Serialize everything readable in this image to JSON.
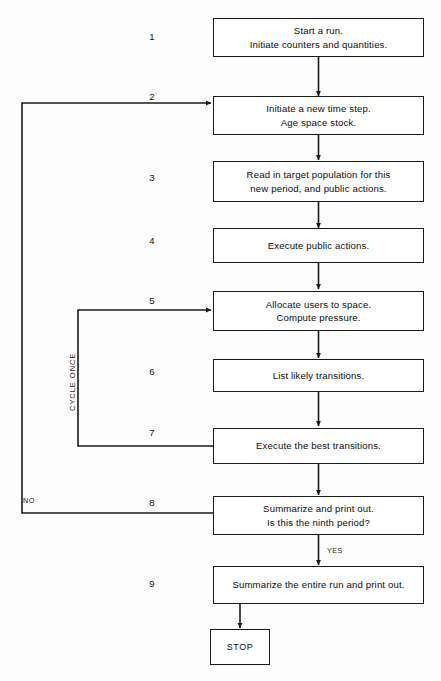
{
  "diagram": {
    "line_color": "#1a1a1a",
    "background": "#fdfdfd"
  },
  "steps": [
    {
      "number": "1",
      "lines": [
        "Start a run.",
        "Initiate counters and quantities."
      ]
    },
    {
      "number": "2",
      "lines": [
        "Initiate a new time step.",
        "Age space stock."
      ]
    },
    {
      "number": "3",
      "lines": [
        "Read in target population for this",
        "new period, and public actions."
      ]
    },
    {
      "number": "4",
      "lines": [
        "Execute public actions."
      ]
    },
    {
      "number": "5",
      "lines": [
        "Allocate users to space.",
        "Compute pressure."
      ]
    },
    {
      "number": "6",
      "lines": [
        "List likely transitions."
      ]
    },
    {
      "number": "7",
      "lines": [
        "Execute the best transitions."
      ]
    },
    {
      "number": "8",
      "lines": [
        "Summarize and print out.",
        "Is this the ninth period?"
      ]
    },
    {
      "number": "9",
      "lines": [
        "Summarize the entire run and print out."
      ]
    }
  ],
  "terminal": {
    "label": "STOP"
  },
  "edge_labels": {
    "no": "NO",
    "yes": "YES",
    "cycle_once": "CYCLE ONCE"
  }
}
